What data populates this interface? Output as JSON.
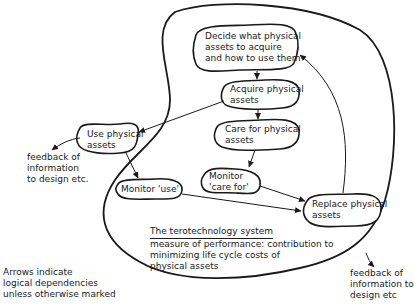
{
  "diagram": {
    "title": "The terotechnology system",
    "subtitle_lines": [
      "measure of performance: contribution to",
      "minimizing life cycle costs of",
      "physical assets"
    ],
    "nodes": [
      {
        "id": "decide",
        "lines": [
          "Decide what physical",
          "assets to acquire",
          "and how to use them"
        ]
      },
      {
        "id": "acquire",
        "lines": [
          "Acquire physical",
          "assets"
        ]
      },
      {
        "id": "care",
        "lines": [
          "Care for physical",
          "assets"
        ]
      },
      {
        "id": "use",
        "lines": [
          "Use physical",
          "assets"
        ]
      },
      {
        "id": "monitor_use",
        "lines": [
          "Monitor 'use'"
        ]
      },
      {
        "id": "monitor_care",
        "lines": [
          "Monitor",
          "'care for'"
        ]
      },
      {
        "id": "replace",
        "lines": [
          "Replace physical",
          "assets"
        ]
      }
    ],
    "edges": [
      {
        "from": "decide",
        "to": "acquire"
      },
      {
        "from": "acquire",
        "to": "care"
      },
      {
        "from": "acquire",
        "to": "use"
      },
      {
        "from": "care",
        "to": "monitor_care"
      },
      {
        "from": "use",
        "to": "monitor_use"
      },
      {
        "from": "monitor_care",
        "to": "replace"
      },
      {
        "from": "monitor_use",
        "to": "replace"
      },
      {
        "from": "replace",
        "to": "decide"
      },
      {
        "from": "use",
        "to": "feedback_left"
      },
      {
        "from": "system_boundary",
        "to": "feedback_right"
      }
    ],
    "feedback_left": [
      "feedback of",
      "information",
      "to design etc."
    ],
    "feedback_right": [
      "feedback of",
      "information to",
      "design etc"
    ],
    "legend": [
      "Arrows indicate",
      "logical dependencies",
      "unless otherwise marked"
    ]
  }
}
